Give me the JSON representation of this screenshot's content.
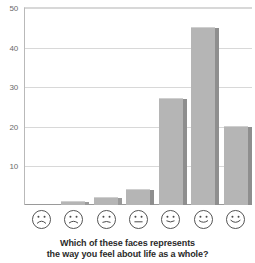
{
  "chart_data": {
    "type": "bar",
    "title": "",
    "xlabel": "",
    "ylabel": "",
    "categories": [
      "very sad face",
      "sad face",
      "slightly sad face",
      "neutral face",
      "slightly happy face",
      "happy face",
      "very happy face"
    ],
    "values": [
      0,
      1,
      2,
      4,
      27,
      45,
      20
    ],
    "ylim": [
      0,
      50
    ],
    "yticks": [
      10,
      20,
      30,
      40,
      50
    ],
    "ytick_labels": [
      "10",
      "20",
      "30",
      "40",
      "50"
    ],
    "grid": true,
    "legend": "none",
    "bar_color": "#b5b5b5",
    "bar_shadow_color": "#8e8e8e",
    "grid_color": "#d8d8d8",
    "axis_color": "#9a9a9a"
  },
  "axis": {
    "y_labels": [
      "50",
      "40",
      "30",
      "20",
      "10"
    ]
  },
  "faces": [
    {
      "name": "face-very-sad",
      "mouth": "M 6 13.5 Q 10 9.5 14 13.5",
      "eyes": "normal"
    },
    {
      "name": "face-sad",
      "mouth": "M 6 13.2 Q 10 10.0 14 13.2",
      "eyes": "normal"
    },
    {
      "name": "face-slightly-sad",
      "mouth": "M 6.5 12.6 Q 10 11.0 13.5 12.6",
      "eyes": "normal"
    },
    {
      "name": "face-neutral",
      "mouth": "M 6.5 12.2 L 13.5 12.2",
      "eyes": "normal"
    },
    {
      "name": "face-slightly-happy",
      "mouth": "M 6.5 11.4 Q 10 13.4 13.5 11.4",
      "eyes": "normal"
    },
    {
      "name": "face-happy",
      "mouth": "M 6 11.2 Q 10 14.2 14 11.2",
      "eyes": "normal"
    },
    {
      "name": "face-very-happy",
      "mouth": "M 5.6 10.8 Q 10 14.8 14.4 10.8",
      "eyes": "normal"
    }
  ],
  "caption": {
    "line1": "Which of these faces represents",
    "line2": "the way you feel about life as a whole?"
  }
}
